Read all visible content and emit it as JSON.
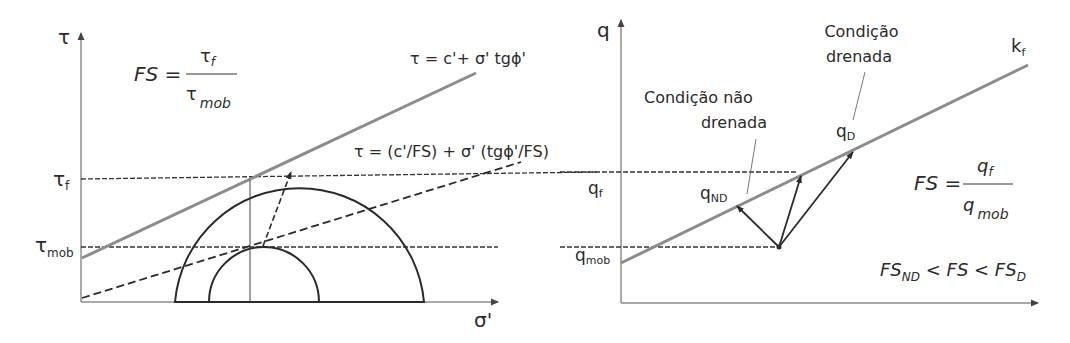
{
  "left_diagram": {
    "y_axis_label": "τ",
    "x_axis_label": "σ'",
    "tau_f_label": "τ",
    "tau_f_sub": "f",
    "tau_mob_label": "τ",
    "tau_mob_sub": "mob",
    "fs_formula": {
      "lhs": "FS =",
      "numerator": "τ",
      "numerator_sub": "f",
      "denominator": "τ",
      "denominator_sub": "mob"
    },
    "envelope_label": "τ = c'+ σ' tgϕ'",
    "mobilized_envelope_label": "τ = (c'/FS) + σ' (tgϕ'/FS)",
    "colors": {
      "envelope": "#8c8c8c",
      "lines": "#2a2a2a"
    }
  },
  "right_diagram": {
    "y_axis_label": "q",
    "kf_label": "k",
    "kf_sub": "f",
    "qf_label": "q",
    "qf_sub": "f",
    "qmob_label": "q",
    "qmob_sub": "mob",
    "qnd_label": "q",
    "qnd_sub": "ND",
    "qd_label": "q",
    "qd_sub": "D",
    "undrained_label_line1": "Condição não",
    "undrained_label_line2": "drenada",
    "drained_label_line1": "Condição",
    "drained_label_line2": "drenada",
    "fs_formula": {
      "lhs": "FS =",
      "numerator": "q",
      "numerator_sub": "f",
      "denominator": "q",
      "denominator_sub": "mob"
    },
    "inequality": {
      "a": "FS",
      "a_sub": "ND",
      "mid": " < FS < ",
      "b": "FS",
      "b_sub": "D"
    }
  }
}
